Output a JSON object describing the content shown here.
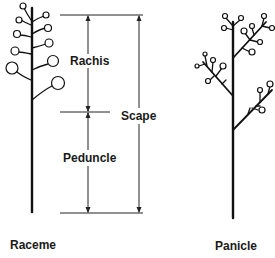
{
  "figure": {
    "type": "botanical inflorescence diagram",
    "labels": {
      "rachis": "Rachis",
      "scape": "Scape",
      "peduncle": "Peduncle",
      "raceme": "Raceme",
      "panicle": "Panicle"
    },
    "ink_color": "#111111",
    "background_color": "#ffffff"
  }
}
